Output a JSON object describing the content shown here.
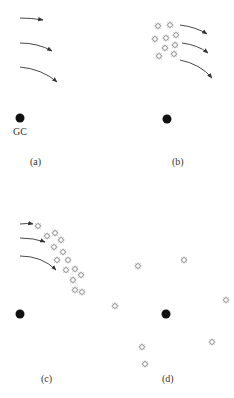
{
  "figure": {
    "panels": [
      {
        "id": "a",
        "label": "(a)"
      },
      {
        "id": "b",
        "label": "(b)"
      },
      {
        "id": "c",
        "label": "(c)"
      },
      {
        "id": "d",
        "label": "(d)"
      }
    ],
    "center_label": "GC",
    "colors": {
      "center": "#111111",
      "arrow": "#333333",
      "star": "#888888"
    }
  }
}
